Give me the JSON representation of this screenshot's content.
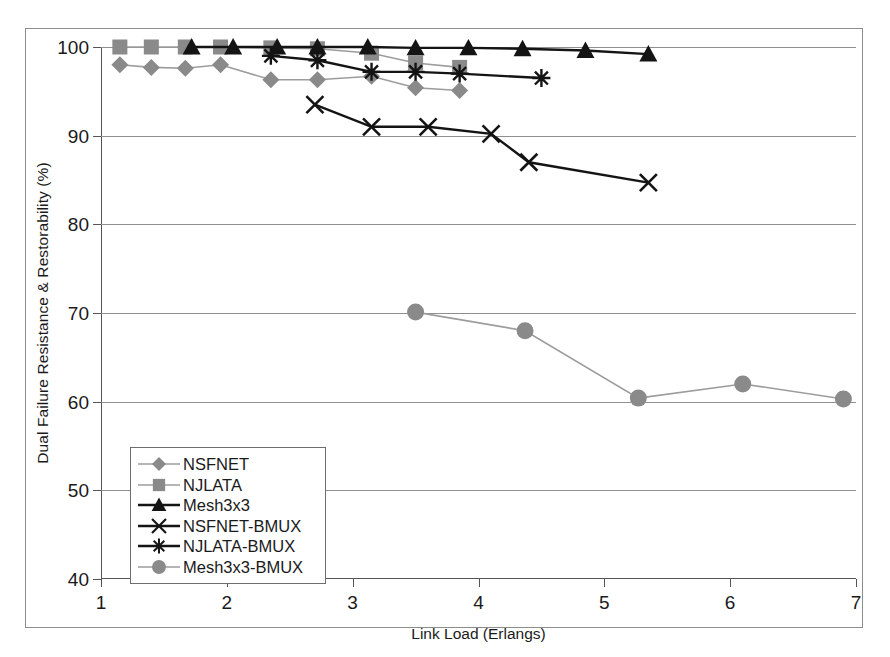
{
  "chart_data": {
    "type": "line",
    "title": "",
    "xlabel": "Link Load (Erlangs)",
    "ylabel": "Dual Failure Resistance & Restorability (%)",
    "xlim": [
      1,
      7
    ],
    "ylim": [
      40,
      100
    ],
    "xticks": [
      1,
      2,
      3,
      4,
      5,
      6,
      7
    ],
    "yticks": [
      40,
      50,
      60,
      70,
      80,
      90,
      100
    ],
    "xtick_labels": [
      "1",
      "2",
      "3",
      "4",
      "5",
      "6",
      "7"
    ],
    "ytick_labels": [
      "40",
      "50",
      "60",
      "70",
      "80",
      "90",
      "100"
    ],
    "grid": "horizontal",
    "legend_position": "lower-left-inside",
    "series": [
      {
        "name": "NSFNET",
        "marker": "diamond",
        "color": "#8a8a8a",
        "line_color": "#9c9c9c",
        "points": [
          [
            1.15,
            98.0
          ],
          [
            1.4,
            97.7
          ],
          [
            1.67,
            97.6
          ],
          [
            1.95,
            98.0
          ],
          [
            2.35,
            96.3
          ],
          [
            2.72,
            96.3
          ],
          [
            3.15,
            96.7
          ],
          [
            3.5,
            95.4
          ],
          [
            3.85,
            95.1
          ]
        ]
      },
      {
        "name": "NJLATA",
        "marker": "square",
        "color": "#8a8a8a",
        "line_color": "#9c9c9c",
        "points": [
          [
            1.15,
            100.0
          ],
          [
            1.4,
            100.0
          ],
          [
            1.67,
            100.0
          ],
          [
            1.95,
            100.0
          ],
          [
            2.35,
            99.9
          ],
          [
            2.72,
            99.8
          ],
          [
            3.15,
            99.3
          ],
          [
            3.5,
            98.2
          ],
          [
            3.85,
            97.7
          ]
        ]
      },
      {
        "name": "Mesh3x3",
        "marker": "triangle",
        "color": "#141414",
        "line_color": "#141414",
        "points": [
          [
            1.72,
            100.0
          ],
          [
            2.05,
            100.0
          ],
          [
            2.4,
            100.0
          ],
          [
            2.72,
            100.0
          ],
          [
            3.12,
            100.0
          ],
          [
            3.5,
            99.9
          ],
          [
            3.92,
            99.9
          ],
          [
            4.35,
            99.8
          ],
          [
            4.85,
            99.6
          ],
          [
            5.35,
            99.2
          ]
        ]
      },
      {
        "name": "NSFNET-BMUX",
        "marker": "x",
        "color": "#141414",
        "line_color": "#141414",
        "points": [
          [
            2.7,
            93.5
          ],
          [
            3.15,
            91.0
          ],
          [
            3.6,
            91.0
          ],
          [
            4.1,
            90.2
          ],
          [
            4.4,
            87.0
          ],
          [
            5.35,
            84.7
          ]
        ]
      },
      {
        "name": "NJLATA-BMUX",
        "marker": "asterisk",
        "color": "#141414",
        "line_color": "#141414",
        "points": [
          [
            2.35,
            99.0
          ],
          [
            2.72,
            98.5
          ],
          [
            3.15,
            97.2
          ],
          [
            3.5,
            97.2
          ],
          [
            3.85,
            97.0
          ],
          [
            4.5,
            96.5
          ]
        ]
      },
      {
        "name": "Mesh3x3-BMUX",
        "marker": "circle",
        "color": "#8a8a8a",
        "line_color": "#9c9c9c",
        "points": [
          [
            3.5,
            70.1
          ],
          [
            4.37,
            68.0
          ],
          [
            5.27,
            60.4
          ],
          [
            6.1,
            62.0
          ],
          [
            6.9,
            60.3
          ]
        ]
      }
    ]
  },
  "legend": {
    "entries": [
      {
        "label": "NSFNET",
        "marker": "diamond-icon"
      },
      {
        "label": "NJLATA",
        "marker": "square-icon"
      },
      {
        "label": "Mesh3x3",
        "marker": "triangle-icon"
      },
      {
        "label": "NSFNET-BMUX",
        "marker": "x-icon"
      },
      {
        "label": "NJLATA-BMUX",
        "marker": "asterisk-icon"
      },
      {
        "label": "Mesh3x3-BMUX",
        "marker": "circle-icon"
      }
    ]
  },
  "colors": {
    "gray_marker": "#8a8a8a",
    "gray_line": "#9c9c9c",
    "black_marker": "#141414",
    "gridline": "#8f8f8f",
    "axis": "#555555",
    "frame": "#8d8d8d",
    "background": "#ffffff"
  }
}
